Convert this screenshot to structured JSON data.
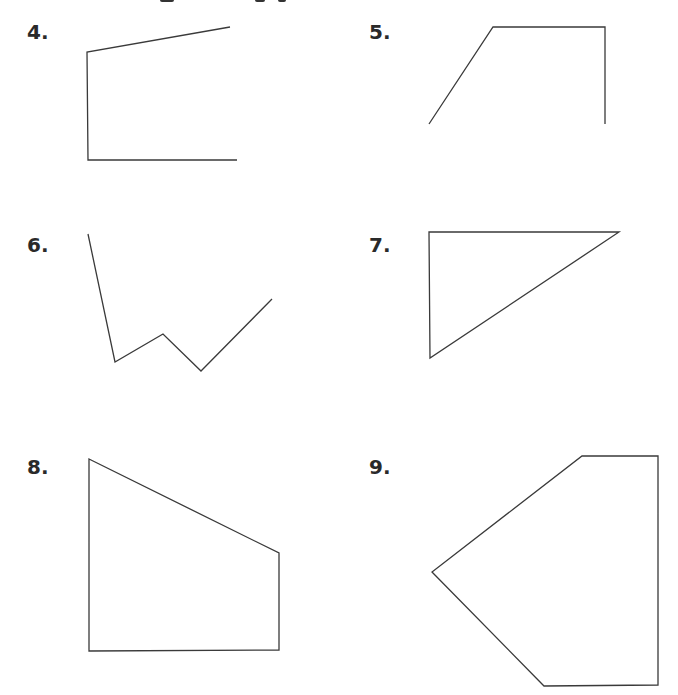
{
  "problems": [
    {
      "label": "4.",
      "shape": "open polyline",
      "points": "230,27 87,52 88,160 237,160",
      "closed": false
    },
    {
      "label": "5.",
      "shape": "open polyline",
      "points": "429,124 493,27 605,27 605,124",
      "closed": false
    },
    {
      "label": "6.",
      "shape": "open polyline",
      "points": "88,234 115,362 163,334 201,371 272,299",
      "closed": false
    },
    {
      "label": "7.",
      "shape": "triangle",
      "points": "429,232 619,232 430,358",
      "closed": true
    },
    {
      "label": "8.",
      "shape": "quadrilateral",
      "points": "89,459 279,553 279,650 89,651",
      "closed": true
    },
    {
      "label": "9.",
      "shape": "pentagon",
      "points": "582,456 658,456 658,685 544,686 432,572",
      "closed": true
    }
  ],
  "colors": {
    "stroke": "#3a3a3a",
    "label": "#2a2a2a",
    "background": "#ffffff"
  }
}
